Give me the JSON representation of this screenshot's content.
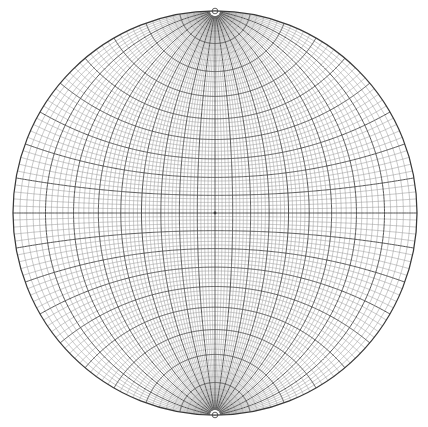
{
  "figure": {
    "kind": "stereonet",
    "canvas_width": 428,
    "canvas_height": 427
  },
  "chart_data": {
    "type": "diagram",
    "projection": "stereographic-equal-angle-wulff",
    "subtitle": "",
    "xlabel": "",
    "ylabel": "",
    "grid": true,
    "legend_position": "none",
    "center_x": 215,
    "center_y": 213,
    "radius": 202,
    "pole_orientation": "vertical",
    "pole_top_label": "N",
    "pole_bottom_label": "S",
    "minor_interval_deg": 2,
    "major_interval_deg": 10,
    "longitude_range_deg": [
      -90,
      90
    ],
    "latitude_range_deg": [
      -90,
      90
    ],
    "minor_longitudes_deg": [
      -88,
      -86,
      -84,
      -82,
      -78,
      -76,
      -74,
      -72,
      -68,
      -66,
      -64,
      -62,
      -58,
      -56,
      -54,
      -52,
      -48,
      -46,
      -44,
      -42,
      -38,
      -36,
      -34,
      -32,
      -28,
      -26,
      -24,
      -22,
      -18,
      -16,
      -14,
      -12,
      -8,
      -6,
      -4,
      -2,
      2,
      4,
      6,
      8,
      12,
      14,
      16,
      18,
      22,
      24,
      26,
      28,
      32,
      34,
      36,
      38,
      42,
      44,
      46,
      48,
      52,
      54,
      56,
      58,
      62,
      64,
      66,
      68,
      72,
      74,
      76,
      78,
      82,
      84,
      86,
      88
    ],
    "major_longitudes_deg": [
      -80,
      -70,
      -60,
      -50,
      -40,
      -30,
      -20,
      -10,
      0,
      10,
      20,
      30,
      40,
      50,
      60,
      70,
      80
    ],
    "minor_latitudes_deg": [
      -88,
      -86,
      -84,
      -82,
      -78,
      -76,
      -74,
      -72,
      -68,
      -66,
      -64,
      -62,
      -58,
      -56,
      -54,
      -52,
      -48,
      -46,
      -44,
      -42,
      -38,
      -36,
      -34,
      -32,
      -28,
      -26,
      -24,
      -22,
      -18,
      -16,
      -14,
      -12,
      -8,
      -6,
      -4,
      -2,
      2,
      4,
      6,
      8,
      12,
      14,
      16,
      18,
      22,
      24,
      26,
      28,
      32,
      34,
      36,
      38,
      42,
      44,
      46,
      48,
      52,
      54,
      56,
      58,
      62,
      64,
      66,
      68,
      72,
      74,
      76,
      78,
      82,
      84,
      86,
      88
    ],
    "major_latitudes_deg": [
      -80,
      -70,
      -60,
      -50,
      -40,
      -30,
      -20,
      -10,
      0,
      10,
      20,
      30,
      40,
      50,
      60,
      70,
      80
    ],
    "equator_deg": 0,
    "prime_meridian_deg": 0,
    "center_dot": true,
    "pole_gap_radius_px": 4,
    "colors": {
      "background": "#ffffff",
      "minor_line": "#9a9a9a",
      "major_line": "#4d4d4d",
      "primitive_circle": "#3a3a3a",
      "center_dot": "#3a3a3a"
    },
    "line_widths": {
      "minor": 0.55,
      "major": 0.95,
      "primitive": 1.25
    }
  }
}
